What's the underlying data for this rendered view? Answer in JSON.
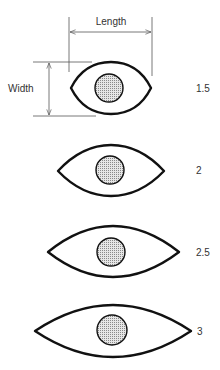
{
  "diagram": {
    "type": "eye-shape-ratio-chart",
    "dimension_labels": {
      "length": "Length",
      "width": "Width"
    },
    "colors": {
      "outline": "#111111",
      "dimension_line": "#555555",
      "pupil_fill": "#cfcfcf",
      "text": "#333333"
    },
    "eyes": [
      {
        "ratio_label": "1.5",
        "left": 71,
        "right": 151,
        "top": 62,
        "bottom": 114,
        "cy": 88,
        "pupil": {
          "cx": 109,
          "cy": 88,
          "r": 14
        }
      },
      {
        "ratio_label": "2",
        "left": 58,
        "right": 164,
        "top": 145,
        "bottom": 196,
        "cy": 171,
        "pupil": {
          "cx": 110,
          "cy": 170,
          "r": 14
        }
      },
      {
        "ratio_label": "2.5",
        "left": 48,
        "right": 179,
        "top": 226,
        "bottom": 276,
        "cy": 251,
        "pupil": {
          "cx": 111,
          "cy": 252,
          "r": 14
        }
      },
      {
        "ratio_label": "3",
        "left": 35,
        "right": 191,
        "top": 305,
        "bottom": 357,
        "cy": 331,
        "pupil": {
          "cx": 112,
          "cy": 330,
          "r": 15
        }
      }
    ]
  }
}
